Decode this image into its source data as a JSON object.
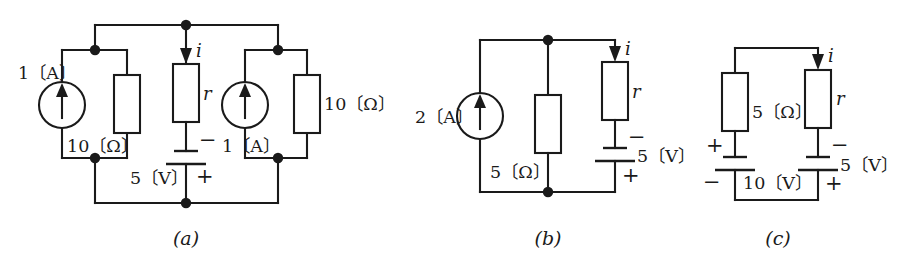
{
  "figure": {
    "ink_color": "#1a1a1a",
    "background": "#ffffff",
    "captions": [
      {
        "id": "a",
        "text": "(a)"
      },
      {
        "id": "b",
        "text": "(b)"
      },
      {
        "id": "c",
        "text": "(c)"
      }
    ]
  },
  "circuit_a": {
    "caption": "(a)",
    "labels": {
      "left_source": "1〔A〕",
      "left_resistor": "10〔Ω〕",
      "right_source": "1〔A〕",
      "right_resistor": "10〔Ω〕",
      "middle_resistor": "r",
      "current": "i",
      "battery_value": "5〔V〕",
      "battery_minus": "−",
      "battery_plus": "+"
    }
  },
  "circuit_b": {
    "caption": "(b)",
    "labels": {
      "source": "2〔A〕",
      "shunt_resistor": "5〔Ω〕",
      "series_resistor": "r",
      "current": "i",
      "battery_value": "5〔V〕",
      "battery_minus": "−",
      "battery_plus": "+"
    }
  },
  "circuit_c": {
    "caption": "(c)",
    "labels": {
      "left_resistor": "5〔Ω〕",
      "right_resistor": "r",
      "current": "i",
      "left_battery_value": "10〔V〕",
      "left_battery_plus": "+",
      "left_battery_minus": "−",
      "right_battery_value": "5〔V〕",
      "right_battery_minus": "−",
      "right_battery_plus": "+"
    }
  }
}
